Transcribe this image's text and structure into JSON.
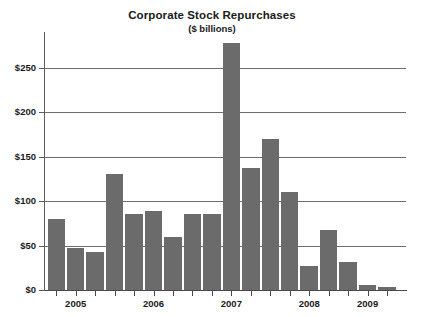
{
  "chart_data": {
    "type": "bar",
    "title": "Corporate Stock Repurchases",
    "subtitle": "($ billions)",
    "xlabel": "",
    "ylabel": "",
    "grid": true,
    "legend": "none",
    "ylim": [
      0,
      290
    ],
    "ytick_labels": [
      "$0",
      "$50",
      "$100",
      "$150",
      "$200",
      "$250"
    ],
    "ytick_values": [
      0,
      50,
      100,
      150,
      200,
      250
    ],
    "xtick_labels": [
      "2005",
      "2006",
      "2007",
      "2008",
      "2009"
    ],
    "categories": [
      "2005 Q1",
      "2005 Q2",
      "2005 Q3",
      "2005 Q4",
      "2006 Q1",
      "2006 Q2",
      "2006 Q3",
      "2006 Q4",
      "2007 Q1",
      "2007 Q2",
      "2007 Q3",
      "2007 Q4",
      "2008 Q1",
      "2008 Q2",
      "2008 Q3",
      "2008 Q4",
      "2009 Q1",
      "2009 Q2"
    ],
    "values": [
      80,
      47,
      43,
      130,
      86,
      89,
      60,
      86,
      86,
      278,
      137,
      170,
      110,
      27,
      67,
      31,
      6,
      3
    ],
    "bar_color": "#6b6b6b",
    "grid_color": "#6d6d6d",
    "axis_color": "#4a4a4a",
    "background": "#ffffff"
  }
}
